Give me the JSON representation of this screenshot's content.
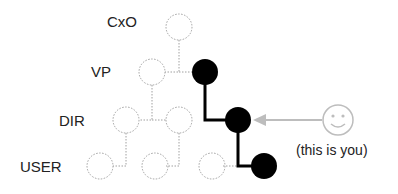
{
  "levels": [
    {
      "label": "CxO"
    },
    {
      "label": "VP"
    },
    {
      "label": "DIR"
    },
    {
      "label": "USER"
    }
  ],
  "annotation": {
    "text": "(this is you)",
    "icon": "smiley-face-icon"
  },
  "colors": {
    "highlight_path": "#000000",
    "dotted_nodes": "#a0a0a0",
    "pointer": "#bdbdbd"
  }
}
